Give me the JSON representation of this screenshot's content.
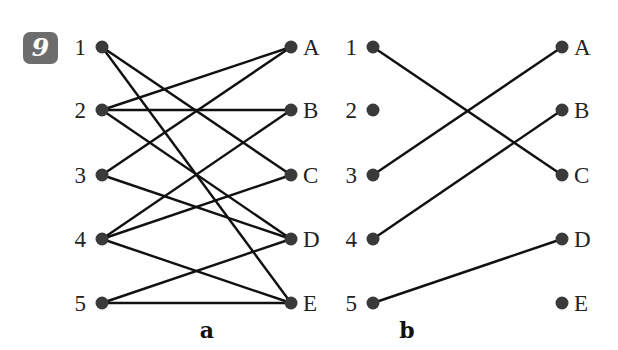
{
  "exercise_number": "9",
  "graphs": [
    {
      "caption": "a",
      "left_nodes": [
        "1",
        "2",
        "3",
        "4",
        "5"
      ],
      "right_nodes": [
        "A",
        "B",
        "C",
        "D",
        "E"
      ],
      "edges": [
        [
          "1",
          "C"
        ],
        [
          "1",
          "E"
        ],
        [
          "2",
          "A"
        ],
        [
          "2",
          "B"
        ],
        [
          "2",
          "D"
        ],
        [
          "3",
          "A"
        ],
        [
          "3",
          "D"
        ],
        [
          "4",
          "B"
        ],
        [
          "4",
          "C"
        ],
        [
          "4",
          "E"
        ],
        [
          "5",
          "D"
        ],
        [
          "5",
          "E"
        ]
      ]
    },
    {
      "caption": "b",
      "left_nodes": [
        "1",
        "2",
        "3",
        "4",
        "5"
      ],
      "right_nodes": [
        "A",
        "B",
        "C",
        "D",
        "E"
      ],
      "edges": [
        [
          "1",
          "C"
        ],
        [
          "3",
          "A"
        ],
        [
          "4",
          "B"
        ],
        [
          "5",
          "D"
        ]
      ]
    }
  ],
  "colors": {
    "node": "#3a3a3a",
    "edge": "#111111",
    "badge": "#6d6d6d"
  }
}
